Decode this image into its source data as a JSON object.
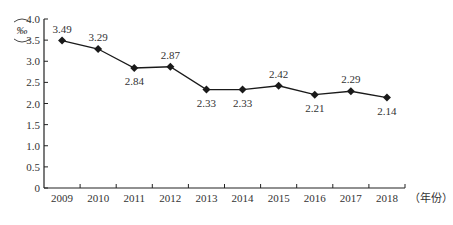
{
  "chart_data": {
    "type": "line",
    "title": "",
    "xlabel": "（年份）",
    "ylabel": "‰",
    "categories": [
      "2009",
      "2010",
      "2011",
      "2012",
      "2013",
      "2014",
      "2015",
      "2016",
      "2017",
      "2018"
    ],
    "series": [
      {
        "name": "rate",
        "values": [
          3.49,
          3.29,
          2.84,
          2.87,
          2.33,
          2.33,
          2.42,
          2.21,
          2.29,
          2.14
        ],
        "marker": "diamond",
        "color": "#1a1a1a"
      }
    ],
    "data_labels": [
      "3.49",
      "3.29",
      "2.84",
      "2.87",
      "2.33",
      "2.33",
      "2.42",
      "2.21",
      "2.29",
      "2.14"
    ],
    "label_positions": [
      "above",
      "above",
      "below",
      "above",
      "below",
      "below",
      "above",
      "below",
      "above",
      "below"
    ],
    "ylim": [
      0,
      4.0
    ],
    "yticks": [
      "0",
      "0.5",
      "1.0",
      "1.5",
      "2.0",
      "2.5",
      "3.0",
      "3.5",
      "4.0"
    ],
    "grid": false,
    "legend": null
  }
}
